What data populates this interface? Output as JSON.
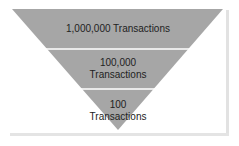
{
  "diagram": {
    "type": "inverted-funnel",
    "fill_color": "#a6a6a6",
    "divider_color": "#ffffff",
    "levels": [
      {
        "line1": "1,000,000 Transactions",
        "line2": ""
      },
      {
        "line1": "100,000",
        "line2": "Transactions"
      },
      {
        "line1": "100",
        "line2": "Transactions"
      }
    ]
  }
}
